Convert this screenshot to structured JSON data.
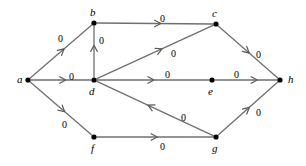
{
  "figure": {
    "background_color": "#ffffff",
    "node_color": "#000000",
    "edge_color": "#6f6f6f",
    "label_color": "#000000",
    "width": 306,
    "height": 166
  },
  "nodes": [
    {
      "id": "a",
      "label": "a",
      "x": 28,
      "y": 80,
      "label_x": 17,
      "label_y": 74
    },
    {
      "id": "b",
      "label": "b",
      "x": 94,
      "y": 23,
      "label_x": 90,
      "label_y": 7
    },
    {
      "id": "c",
      "label": "c",
      "x": 216,
      "y": 24,
      "label_x": 212,
      "label_y": 8
    },
    {
      "id": "d",
      "label": "d",
      "x": 94,
      "y": 80,
      "label_x": 89,
      "label_y": 86
    },
    {
      "id": "e",
      "label": "e",
      "x": 212,
      "y": 80,
      "label_x": 208,
      "label_y": 86
    },
    {
      "id": "f",
      "label": "f",
      "x": 94,
      "y": 137,
      "label_x": 91,
      "label_y": 143
    },
    {
      "id": "g",
      "label": "g",
      "x": 216,
      "y": 137,
      "label_x": 212,
      "label_y": 143
    },
    {
      "id": "h",
      "label": "h",
      "x": 280,
      "y": 80,
      "label_x": 288,
      "label_y": 74
    }
  ],
  "edges": [
    {
      "id": "a-b",
      "from": "a",
      "to": "b",
      "label": "0",
      "label_x": 58,
      "label_y": 34,
      "arrow_t": 0.55
    },
    {
      "id": "a-d",
      "from": "a",
      "to": "d",
      "label": "0",
      "label_x": 69,
      "label_y": 72,
      "arrow_t": 0.58
    },
    {
      "id": "a-f",
      "from": "a",
      "to": "f",
      "label": "0",
      "label_x": 62,
      "label_y": 120,
      "arrow_t": 0.56
    },
    {
      "id": "b-c",
      "from": "b",
      "to": "c",
      "label": "0",
      "label_x": 160,
      "label_y": 14,
      "arrow_t": 0.55
    },
    {
      "id": "d-b",
      "from": "d",
      "to": "b",
      "label": "0",
      "label_x": 99,
      "label_y": 36,
      "arrow_t": 0.62
    },
    {
      "id": "d-c",
      "from": "d",
      "to": "c",
      "label": "0",
      "label_x": 171,
      "label_y": 49,
      "arrow_t": 0.56
    },
    {
      "id": "d-e",
      "from": "d",
      "to": "e",
      "label": "0",
      "label_x": 165,
      "label_y": 70,
      "arrow_t": 0.51
    },
    {
      "id": "e-h",
      "from": "e",
      "to": "h",
      "label": "0",
      "label_x": 234,
      "label_y": 70,
      "arrow_t": 0.68
    },
    {
      "id": "c-h",
      "from": "c",
      "to": "h",
      "label": "0",
      "label_x": 256,
      "label_y": 50,
      "arrow_t": 0.52
    },
    {
      "id": "f-g",
      "from": "f",
      "to": "g",
      "label": "0",
      "label_x": 160,
      "label_y": 142,
      "arrow_t": 0.52
    },
    {
      "id": "g-d",
      "from": "g",
      "to": "d",
      "label": "0",
      "label_x": 181,
      "label_y": 113,
      "arrow_t": 0.56
    },
    {
      "id": "g-h",
      "from": "g",
      "to": "h",
      "label": "0",
      "label_x": 256,
      "label_y": 108,
      "arrow_t": 0.52
    }
  ]
}
